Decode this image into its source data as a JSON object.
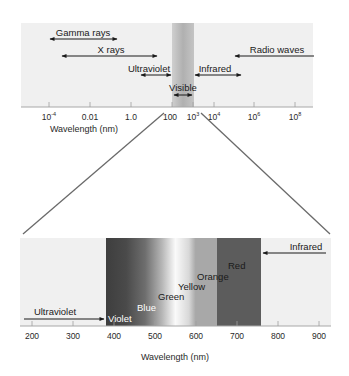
{
  "top_panel": {
    "regions": [
      {
        "label": "Gamma rays"
      },
      {
        "label": "X rays"
      },
      {
        "label": "Ultraviolet"
      },
      {
        "label": "Visible"
      },
      {
        "label": "Infrared"
      },
      {
        "label": "Radio waves"
      }
    ],
    "ticks": [
      {
        "base": "10",
        "exp": "-4"
      },
      {
        "base": "0.01",
        "exp": ""
      },
      {
        "base": "1.0",
        "exp": ""
      },
      {
        "base": "100",
        "exp": ""
      },
      {
        "base": "10",
        "exp": "3"
      },
      {
        "base": "10",
        "exp": "4"
      },
      {
        "base": "10",
        "exp": "6"
      },
      {
        "base": "10",
        "exp": "8"
      }
    ],
    "xlabel": "Wavelength (nm)"
  },
  "bottom_panel": {
    "ultraviolet_label": "Ultraviolet",
    "infrared_label": "Infrared",
    "colors": [
      {
        "label": "Violet"
      },
      {
        "label": "Blue"
      },
      {
        "label": "Green"
      },
      {
        "label": "Yellow"
      },
      {
        "label": "Orange"
      },
      {
        "label": "Red"
      }
    ],
    "ticks": [
      "200",
      "300",
      "400",
      "500",
      "600",
      "700",
      "800",
      "900"
    ],
    "xlabel": "Wavelength (nm)"
  },
  "style": {
    "panel_bg": "#f0f0f0",
    "axis_color": "#9a9a9a",
    "arrow_color": "#1a1a1a",
    "visible_band": "#b8b8b8",
    "red_band": "#5a5a5a"
  }
}
